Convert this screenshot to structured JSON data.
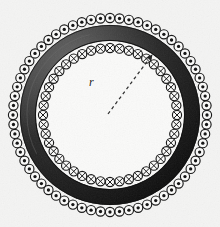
{
  "figure": {
    "type": "physics-diagram",
    "width": 220,
    "height": 227,
    "background_color": "#f4f4f3"
  },
  "geometry": {
    "center_x": 110,
    "center_y": 115,
    "outer_winding_ring_radius": 97,
    "inner_winding_ring_radius": 67,
    "core_outer_radius": 90,
    "core_inner_radius": 74,
    "winding_symbol_radius": 4.6,
    "outer_symbol_count": 64,
    "inner_symbol_count": 44,
    "inner_cavity_radius": 62
  },
  "colors": {
    "core_dark": "#151515",
    "core_mid": "#3a3a3a",
    "core_light": "#6e6e6e",
    "symbol_fill": "#fbfbfa",
    "symbol_stroke": "#141414",
    "dot_fill": "#101010",
    "cross_stroke": "#141414",
    "cavity_fill": "#fafaf9",
    "radius_line": "#2b2b2b",
    "label_color": "#1a1a1a"
  },
  "symbols": {
    "outer_ring": {
      "glyph": "dot",
      "meaning": "current out of page",
      "count": 64
    },
    "inner_ring": {
      "glyph": "cross",
      "meaning": "current into page",
      "count": 44
    }
  },
  "annotations": {
    "radius": {
      "label": "r",
      "style": "italic",
      "line_style": "dashed",
      "from_x": 108,
      "from_y": 114,
      "to_x": 152,
      "to_y": 55,
      "label_x": 89,
      "label_y": 86,
      "arrowhead": true
    }
  }
}
